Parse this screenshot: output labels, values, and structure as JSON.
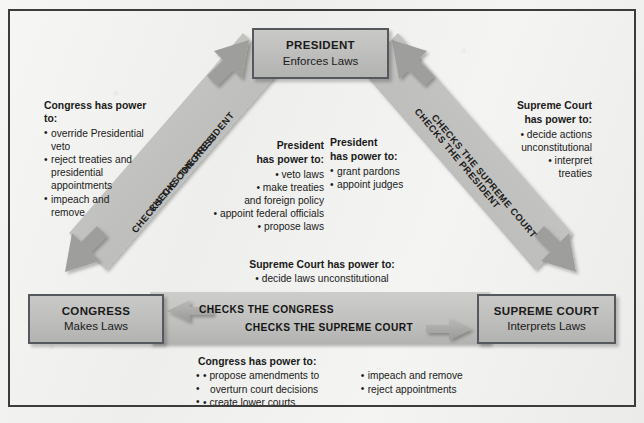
{
  "diagram": {
    "colors": {
      "page_background": "#f2f2f0",
      "band_fill": "#c2c2c0",
      "band_fill_dark": "#aeaeac",
      "node_fill": "#c0c0be",
      "node_border": "#55585c",
      "frame_border": "#3c3c3c",
      "text": "#1a1a1a"
    }
  },
  "nodes": {
    "president": {
      "title": "PRESIDENT",
      "subtitle": "Enforces Laws"
    },
    "congress": {
      "title": "CONGRESS",
      "subtitle": "Makes Laws"
    },
    "supreme_court": {
      "title": "SUPREME COURT",
      "subtitle": "Interprets Laws"
    }
  },
  "band_labels": {
    "left_upper": "CHECKS THE PRESIDENT",
    "left_lower": "CHECKS THE CONGRESS",
    "right_upper": "CHECKS THE PRESIDENT",
    "right_lower": "CHECKS THE SUPREME COURT",
    "bottom_upper": "CHECKS THE CONGRESS",
    "bottom_lower": "CHECKS THE SUPREME COURT"
  },
  "power_blocks": {
    "congress_checks_president": {
      "heading": "Congress has power to:",
      "items": [
        "override Presidential veto",
        "reject treaties and presidential appointments",
        "impeach and remove"
      ],
      "lines": [
        "override Presidential",
        "veto",
        "reject treaties and",
        "presidential",
        "appointments",
        "impeach and",
        "remove"
      ]
    },
    "president_checks_congress": {
      "heading_line1": "President",
      "heading_line2": "has power to:",
      "items": [
        "veto laws",
        "make treaties and foreign policy",
        "appoint federal officials",
        "propose laws"
      ],
      "lines": [
        "• veto laws",
        "• make treaties",
        "and foreign policy",
        "• appoint federal officials",
        "• propose laws"
      ]
    },
    "president_checks_supreme": {
      "heading_line1": "President",
      "heading_line2": "has power to:",
      "items": [
        "grant pardons",
        "appoint judges"
      ]
    },
    "supreme_checks_president": {
      "heading_line1": "Supreme Court",
      "heading_line2": "has power to:",
      "items": [
        "decide actions unconstitutional",
        "interpret treaties"
      ],
      "lines": [
        "• decide actions",
        "unconstitutional",
        "• interpret",
        "treaties"
      ]
    },
    "supreme_checks_congress": {
      "heading": "Supreme Court has power to:",
      "items": [
        "decide laws unconstitutional"
      ]
    },
    "congress_checks_supreme": {
      "heading": "Congress has power to:",
      "items_col1": [
        "propose amendments to overturn court decisions",
        "create lower courts"
      ],
      "col1_lines": [
        "• propose amendments to",
        "overturn court decisions",
        "• create lower courts"
      ],
      "items_col2": [
        "impeach and remove",
        "reject appointments"
      ]
    }
  }
}
